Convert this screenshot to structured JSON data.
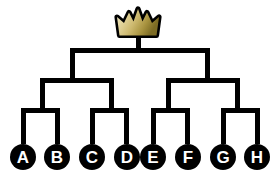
{
  "figure": {
    "name": "single-elimination-tournament-bracket",
    "background_color": "#ffffff",
    "line_color": "#000000",
    "line_thickness_px": 5,
    "node_fill_color": "#000000",
    "node_text_color": "#ffffff",
    "champion_icon": "crown-icon",
    "crown_colors": {
      "outline": "#000000",
      "gradient_start": "#f2eccd",
      "gradient_mid": "#d8c88a",
      "gradient_end": "#8a7a2e"
    },
    "rounds": 3,
    "teams_count": 8
  },
  "teams": [
    {
      "label": "A",
      "seed": 1,
      "cx": 23,
      "cy": 157
    },
    {
      "label": "B",
      "seed": 2,
      "cx": 57,
      "cy": 157
    },
    {
      "label": "C",
      "seed": 3,
      "cx": 92,
      "cy": 157
    },
    {
      "label": "D",
      "seed": 4,
      "cx": 127,
      "cy": 157
    },
    {
      "label": "E",
      "seed": 5,
      "cx": 153,
      "cy": 157
    },
    {
      "label": "F",
      "seed": 6,
      "cx": 188,
      "cy": 157
    },
    {
      "label": "G",
      "seed": 7,
      "cx": 223,
      "cy": 157
    },
    {
      "label": "H",
      "seed": 8,
      "cx": 257,
      "cy": 157
    }
  ],
  "connectors": {
    "round1_label": "quarterfinals",
    "round2_label": "semifinals",
    "round3_label": "final",
    "round1": [
      {
        "name": "match-a-vs-b",
        "left": 23,
        "right": 57,
        "y": 110,
        "stem_to": 142
      },
      {
        "name": "match-c-vs-d",
        "left": 92,
        "right": 127,
        "y": 110,
        "stem_to": 142
      },
      {
        "name": "match-e-vs-f",
        "left": 153,
        "right": 188,
        "y": 110,
        "stem_to": 142
      },
      {
        "name": "match-g-vs-h",
        "left": 223,
        "right": 257,
        "y": 110,
        "stem_to": 142
      }
    ],
    "round2": [
      {
        "name": "semifinal-left",
        "left": 40,
        "right": 109,
        "y": 80,
        "stem_to": 110
      },
      {
        "name": "semifinal-right",
        "left": 170,
        "right": 240,
        "y": 80,
        "stem_to": 110
      }
    ],
    "round3": [
      {
        "name": "final-match",
        "left": 70,
        "right": 205,
        "y": 50,
        "stem_to": 80
      }
    ],
    "champion_stem": {
      "name": "champion-stem",
      "x": 138,
      "top": 36,
      "bottom": 50
    }
  }
}
